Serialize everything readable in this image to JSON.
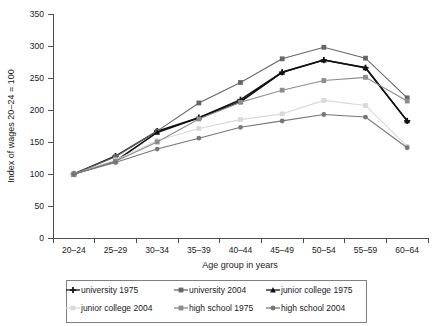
{
  "chart_data": {
    "type": "line",
    "title": "",
    "xlabel": "Age group in years",
    "ylabel": "Index of wages 20–24 = 100",
    "categories": [
      "20–24",
      "25–29",
      "30–34",
      "35–39",
      "40–44",
      "45–49",
      "50–54",
      "55–59",
      "60–64"
    ],
    "ylim": [
      0,
      350
    ],
    "yticks": [
      0,
      50,
      100,
      150,
      200,
      250,
      300,
      350
    ],
    "grid": false,
    "legend_position": "bottom",
    "series": [
      {
        "name": "university 1975",
        "color": "#1a1a1a",
        "marker": "cross",
        "values": [
          100,
          128,
          167,
          188,
          216,
          259,
          278,
          266,
          183
        ]
      },
      {
        "name": "university 2004",
        "color": "#666666",
        "marker": "square",
        "values": [
          100,
          127,
          167,
          211,
          243,
          280,
          298,
          281,
          219
        ]
      },
      {
        "name": "junior college 1975",
        "color": "#111111",
        "marker": "triangle",
        "values": [
          100,
          120,
          165,
          188,
          213,
          259,
          278,
          266,
          183
        ]
      },
      {
        "name": "junior college 2004",
        "color": "#d9d9d9",
        "marker": "square",
        "values": [
          100,
          122,
          152,
          171,
          185,
          194,
          215,
          207,
          143
        ]
      },
      {
        "name": "high school 1975",
        "color": "#8c8c8c",
        "marker": "square",
        "values": [
          100,
          120,
          150,
          186,
          212,
          231,
          246,
          251,
          214
        ]
      },
      {
        "name": "high school 2004",
        "color": "#777777",
        "marker": "circle",
        "values": [
          100,
          118,
          139,
          156,
          173,
          183,
          193,
          189,
          141
        ]
      }
    ]
  },
  "legend": {
    "entries": [
      {
        "label": "university 1975"
      },
      {
        "label": "university 2004"
      },
      {
        "label": "junior college 1975"
      },
      {
        "label": "junior college 2004"
      },
      {
        "label": "high school 1975"
      },
      {
        "label": "high school 2004"
      }
    ]
  },
  "colors": {
    "axis": "#4d4d4d",
    "text": "#1a1a1a",
    "legend_border": "#808080",
    "background": "#ffffff"
  }
}
